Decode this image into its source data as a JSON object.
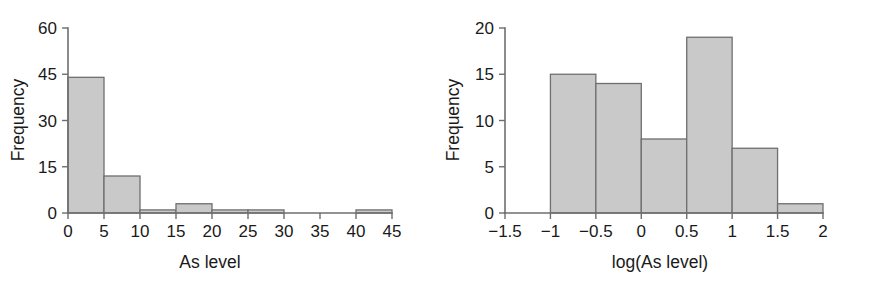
{
  "figure": {
    "background_color": "#ffffff",
    "bar_fill_color": "#c9c9c9",
    "bar_edge_color": "#6f6f6f",
    "axis_color": "#6e6e6e",
    "text_color": "#1a1a1a"
  },
  "chart_data": [
    {
      "type": "bar",
      "id": "as-level-histogram",
      "title": "",
      "xlabel": "As level",
      "ylabel": "Frequency",
      "xlim": [
        0,
        45
      ],
      "ylim": [
        0,
        60
      ],
      "grid": false,
      "legend": false,
      "xticks": [
        0,
        5,
        10,
        15,
        20,
        25,
        30,
        35,
        40,
        45
      ],
      "xticklabels": [
        "0",
        "5",
        "10",
        "15",
        "20",
        "25",
        "30",
        "35",
        "40",
        "45"
      ],
      "yticks": [
        0,
        15,
        30,
        45,
        60
      ],
      "yticklabels": [
        "0",
        "15",
        "30",
        "45",
        "60"
      ],
      "bins": [
        {
          "left": 0,
          "right": 5,
          "value": 44
        },
        {
          "left": 5,
          "right": 10,
          "value": 12
        },
        {
          "left": 10,
          "right": 15,
          "value": 1
        },
        {
          "left": 15,
          "right": 20,
          "value": 3
        },
        {
          "left": 20,
          "right": 25,
          "value": 1
        },
        {
          "left": 25,
          "right": 30,
          "value": 1
        },
        {
          "left": 30,
          "right": 35,
          "value": 0
        },
        {
          "left": 35,
          "right": 40,
          "value": 0
        },
        {
          "left": 40,
          "right": 45,
          "value": 1
        }
      ],
      "categories": [
        "0-5",
        "5-10",
        "10-15",
        "15-20",
        "20-25",
        "25-30",
        "30-35",
        "35-40",
        "40-45"
      ],
      "values": [
        44,
        12,
        1,
        3,
        1,
        1,
        0,
        0,
        1
      ]
    },
    {
      "type": "bar",
      "id": "log-as-level-histogram",
      "title": "",
      "xlabel": "log(As level)",
      "ylabel": "Frequency",
      "xlim": [
        -1.5,
        2
      ],
      "ylim": [
        0,
        20
      ],
      "grid": false,
      "legend": false,
      "xticks": [
        -1.5,
        -1,
        -0.5,
        0,
        0.5,
        1,
        1.5,
        2
      ],
      "xticklabels": [
        "−1.5",
        "−1",
        "−0.5",
        "0",
        "0.5",
        "1",
        "1.5",
        "2"
      ],
      "yticks": [
        0,
        5,
        10,
        15,
        20
      ],
      "yticklabels": [
        "0",
        "5",
        "10",
        "15",
        "20"
      ],
      "bins": [
        {
          "left": -1.5,
          "right": -1,
          "value": 0
        },
        {
          "left": -1,
          "right": -0.5,
          "value": 15
        },
        {
          "left": -0.5,
          "right": 0,
          "value": 14
        },
        {
          "left": 0,
          "right": 0.5,
          "value": 8
        },
        {
          "left": 0.5,
          "right": 1,
          "value": 19
        },
        {
          "left": 1,
          "right": 1.5,
          "value": 7
        },
        {
          "left": 1.5,
          "right": 2,
          "value": 1
        }
      ],
      "categories": [
        "-1.5 to -1",
        "-1 to -0.5",
        "-0.5 to 0",
        "0 to 0.5",
        "0.5 to 1",
        "1 to 1.5",
        "1.5 to 2"
      ],
      "values": [
        0,
        15,
        14,
        8,
        19,
        7,
        1
      ]
    }
  ]
}
